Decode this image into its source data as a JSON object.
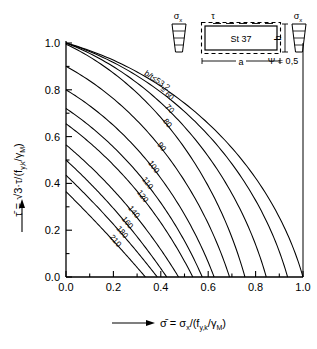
{
  "chart_data": {
    "type": "line",
    "title": "",
    "xlabel": "σ̄ = σx/(fy,k/γM)",
    "ylabel": "τ̄ = √3·τ/(fy,k/γM)",
    "xlim": [
      0.0,
      1.0
    ],
    "ylim": [
      0.0,
      1.0
    ],
    "xticks": [
      "0.0",
      "0.2",
      "0.4",
      "0.6",
      "0.8",
      "1.0"
    ],
    "yticks": [
      "0.0",
      "0.2",
      "0.4",
      "0.6",
      "0.8",
      "1.0"
    ],
    "grid": false,
    "legend": "inline curve labels",
    "series": [
      {
        "name": "b/t ≤ 53,2",
        "label": "b/t≤53,2",
        "y0": 1.0,
        "x0": 1.0,
        "bulge": 0.62
      },
      {
        "name": "= 60",
        "label": "= 60",
        "y0": 1.0,
        "x0": 0.935,
        "bulge": 0.6
      },
      {
        "name": "70",
        "label": "70",
        "y0": 1.0,
        "x0": 0.845,
        "bulge": 0.565
      },
      {
        "name": "80",
        "label": "80",
        "y0": 0.995,
        "x0": 0.755,
        "bulge": 0.53
      },
      {
        "name": "90",
        "label": "90",
        "y0": 0.9,
        "x0": 0.69,
        "bulge": 0.47
      },
      {
        "name": "100",
        "label": "100",
        "y0": 0.8,
        "x0": 0.625,
        "bulge": 0.41
      },
      {
        "name": "110",
        "label": "110",
        "y0": 0.72,
        "x0": 0.575,
        "bulge": 0.35
      },
      {
        "name": "120",
        "label": "120",
        "y0": 0.655,
        "x0": 0.535,
        "bulge": 0.29
      },
      {
        "name": "140",
        "label": "140",
        "y0": 0.565,
        "x0": 0.475,
        "bulge": 0.2
      },
      {
        "name": "160",
        "label": "160",
        "y0": 0.5,
        "x0": 0.425,
        "bulge": 0.14
      },
      {
        "name": "180",
        "label": "180",
        "y0": 0.435,
        "x0": 0.385,
        "bulge": 0.09
      },
      {
        "name": "210",
        "label": "210",
        "y0": 0.365,
        "x0": 0.335,
        "bulge": 0.05
      }
    ]
  },
  "axes": {
    "x": {
      "ticks": [
        "0.0",
        "0.2",
        "0.4",
        "0.6",
        "0.8",
        "1.0"
      ],
      "label_sigma": "σ̄",
      "label_eq": "=",
      "label_num": "σ",
      "label_num_sub": "x",
      "label_slash": "/(",
      "label_den": "f",
      "label_den_sub": "y,k",
      "label_den2": "/γ",
      "label_den2_sub": "M",
      "label_close": ")"
    },
    "y": {
      "ticks": [
        "0.0",
        "0.2",
        "0.4",
        "0.6",
        "0.8",
        "1.0"
      ],
      "label_tau": "τ̄",
      "label_eq": "=",
      "label_sqrt": "√3",
      "label_dot": "·τ/(",
      "label_den": "f",
      "label_den_sub": "y,k",
      "label_den2": "/γ",
      "label_den2_sub": "M",
      "label_close": ")"
    }
  },
  "inset": {
    "material": "St 37",
    "tau_label": "τ",
    "sigma_left": "σ",
    "sigma_left_sub": "x",
    "sigma_right": "σ",
    "sigma_right_sub": "x",
    "dim_a": "a",
    "dim_b": "b",
    "psi": "Ψ = 0,5"
  },
  "curve_labels": [
    "b/t≤53,2",
    "= 60",
    "70",
    "80",
    "90",
    "100",
    "110",
    "120",
    "140",
    "160",
    "180",
    "210"
  ],
  "colors": {
    "ink": "#000000",
    "background": "#ffffff"
  }
}
